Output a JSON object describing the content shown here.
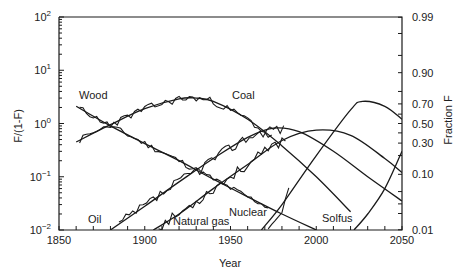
{
  "chart_data": {
    "type": "line",
    "title": "",
    "xlabel": "Year",
    "ylabel": "F/(1-F)",
    "y2label": "Fraction F",
    "xlim": [
      1850,
      2050
    ],
    "ylim": [
      0.01,
      100
    ],
    "yscale": "log",
    "x_ticks": [
      "1850",
      "1900",
      "1950",
      "2000",
      "2050"
    ],
    "y_ticks": [
      {
        "value": 100,
        "label": "10",
        "exp": "2"
      },
      {
        "value": 10,
        "label": "10",
        "exp": "1"
      },
      {
        "value": 1,
        "label": "10",
        "exp": "0"
      },
      {
        "value": 0.1,
        "label": "10",
        "exp": "−1"
      },
      {
        "value": 0.01,
        "label": "10",
        "exp": "−2"
      }
    ],
    "y2_ticks": [
      "0.99",
      "0.90",
      "0.70",
      "0.50",
      "0.30",
      "0.10",
      "0.01"
    ],
    "y2_tick_values": [
      0.99,
      0.9,
      0.7,
      0.5,
      0.3,
      0.1,
      0.01
    ],
    "grid": false,
    "legend": "inline labels",
    "series": [
      {
        "name": "Wood",
        "label_pos": [
          1856,
          1.9
        ],
        "x": [
          1860,
          1880,
          1900,
          1920,
          1940,
          1960,
          1980,
          2000
        ],
        "values": [
          2.1,
          0.9,
          0.42,
          0.2,
          0.09,
          0.042,
          0.02,
          0.01
        ]
      },
      {
        "name": "Coal",
        "label_pos": [
          1945,
          1.9
        ],
        "x": [
          1860,
          1880,
          1900,
          1920,
          1930,
          1940,
          1960,
          1980,
          2000,
          2020
        ],
        "values": [
          0.45,
          0.95,
          1.9,
          2.9,
          3.0,
          2.6,
          1.2,
          0.38,
          0.1,
          0.022
        ]
      },
      {
        "name": "Oil",
        "label_pos": [
          1875,
          0.012
        ],
        "x": [
          1880,
          1900,
          1920,
          1940,
          1960,
          1975,
          1990,
          2010,
          2030,
          2050
        ],
        "values": [
          0.01,
          0.028,
          0.08,
          0.22,
          0.55,
          0.82,
          0.7,
          0.3,
          0.1,
          0.035
        ]
      },
      {
        "name": "Natural gas",
        "label_pos": [
          1915,
          0.012
        ],
        "x": [
          1905,
          1920,
          1940,
          1960,
          1980,
          2000,
          2020,
          2040,
          2050
        ],
        "values": [
          0.01,
          0.02,
          0.06,
          0.17,
          0.48,
          0.75,
          0.6,
          0.22,
          0.12
        ]
      },
      {
        "name": "Nuclear",
        "label_pos": [
          1957,
          0.018
        ],
        "x": [
          1968,
          1980,
          2000,
          2020,
          2027,
          2040,
          2050
        ],
        "values": [
          0.01,
          0.03,
          0.25,
          1.8,
          2.6,
          2.1,
          1.2
        ]
      },
      {
        "name": "Solfus",
        "label_pos": [
          1990,
          0.012
        ],
        "x": [
          2022,
          2030,
          2040,
          2050
        ],
        "values": [
          0.01,
          0.02,
          0.06,
          0.3
        ]
      }
    ]
  },
  "labels": {
    "wood": "Wood",
    "coal": "Coal",
    "oil": "Oil",
    "natural_gas": "Natural gas",
    "nuclear": "Nuclear",
    "solfus": "Solfus",
    "xlabel": "Year",
    "ylabel": "F/(1-F)",
    "y2label": "Fraction F"
  }
}
